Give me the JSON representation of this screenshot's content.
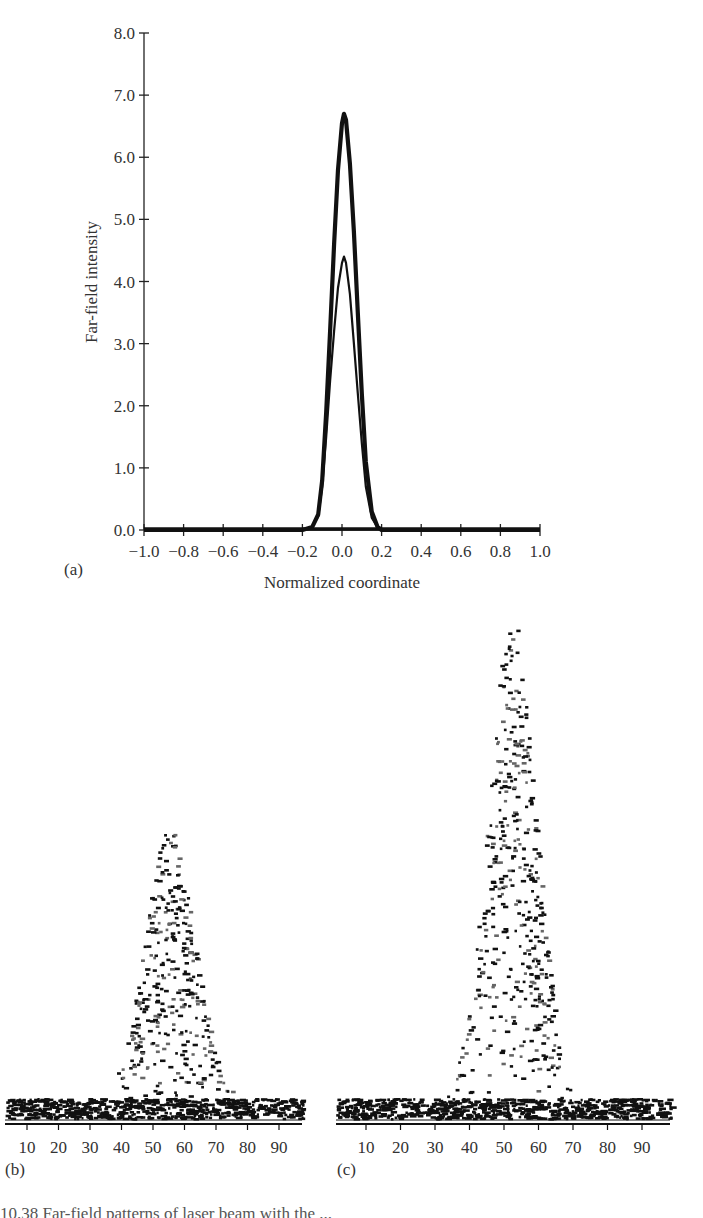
{
  "chart_data": [
    {
      "panel": "(a)",
      "type": "line",
      "title": "",
      "xlabel": "Normalized coordinate",
      "ylabel": "Far-field intensity",
      "xlim": [
        -1.0,
        1.0
      ],
      "ylim": [
        0.0,
        8.0
      ],
      "grid": false,
      "legend": null,
      "x_ticks": [
        "−1.0",
        "−0.8",
        "−0.6",
        "−0.4",
        "−0.2",
        "0.0",
        "0.2",
        "0.4",
        "0.6",
        "0.8",
        "1.0"
      ],
      "y_ticks": [
        "0.0",
        "1.0",
        "2.0",
        "3.0",
        "4.0",
        "5.0",
        "6.0",
        "7.0",
        "8.0"
      ],
      "series": [
        {
          "name": "outer profile (thick)",
          "x": [
            -1.0,
            -0.2,
            -0.15,
            -0.12,
            -0.1,
            -0.08,
            -0.06,
            -0.04,
            -0.02,
            0.0,
            0.01,
            0.02,
            0.04,
            0.06,
            0.08,
            0.1,
            0.12,
            0.15,
            0.18,
            0.2,
            1.0
          ],
          "values": [
            0.0,
            0.0,
            0.05,
            0.25,
            0.8,
            1.9,
            3.2,
            4.6,
            5.8,
            6.55,
            6.7,
            6.6,
            5.9,
            4.8,
            3.5,
            2.2,
            1.1,
            0.3,
            0.05,
            0.0,
            0.0
          ]
        },
        {
          "name": "inner profile (thin)",
          "x": [
            -1.0,
            -0.2,
            -0.15,
            -0.12,
            -0.1,
            -0.08,
            -0.06,
            -0.04,
            -0.02,
            0.0,
            0.01,
            0.02,
            0.04,
            0.06,
            0.08,
            0.1,
            0.12,
            0.15,
            0.18,
            0.2,
            1.0
          ],
          "values": [
            0.0,
            0.0,
            0.05,
            0.22,
            0.7,
            1.5,
            2.4,
            3.2,
            3.9,
            4.3,
            4.4,
            4.3,
            3.8,
            3.0,
            2.2,
            1.4,
            0.7,
            0.2,
            0.04,
            0.0,
            0.0
          ]
        }
      ]
    },
    {
      "panel": "(b)",
      "type": "scatter",
      "title": "",
      "xlabel": "",
      "ylabel": "",
      "xlim": [
        0,
        98
      ],
      "x_ticks": [
        "10",
        "20",
        "30",
        "40",
        "50",
        "60",
        "70",
        "80",
        "90"
      ],
      "grid": false,
      "description": "Noisy speckle scatter of far-field intensity; dense noise band at baseline with a Gaussian-like peak",
      "peak_x": 55,
      "peak_relative_height": 0.62,
      "fwhm_x": 18
    },
    {
      "panel": "(c)",
      "type": "scatter",
      "title": "",
      "xlabel": "",
      "ylabel": "",
      "xlim": [
        0,
        98
      ],
      "x_ticks": [
        "10",
        "20",
        "30",
        "40",
        "50",
        "60",
        "70",
        "80",
        "90"
      ],
      "grid": false,
      "description": "Noisy speckle scatter of far-field intensity; dense noise band at baseline with a taller, narrower Gaussian-like peak",
      "peak_x": 52,
      "peak_relative_height": 1.0,
      "fwhm_x": 16
    }
  ],
  "labels": {
    "panel_a": "(a)",
    "panel_b": "(b)",
    "panel_c": "(c)"
  },
  "caption": "10.38   Far-field patterns of laser beam with the ..."
}
